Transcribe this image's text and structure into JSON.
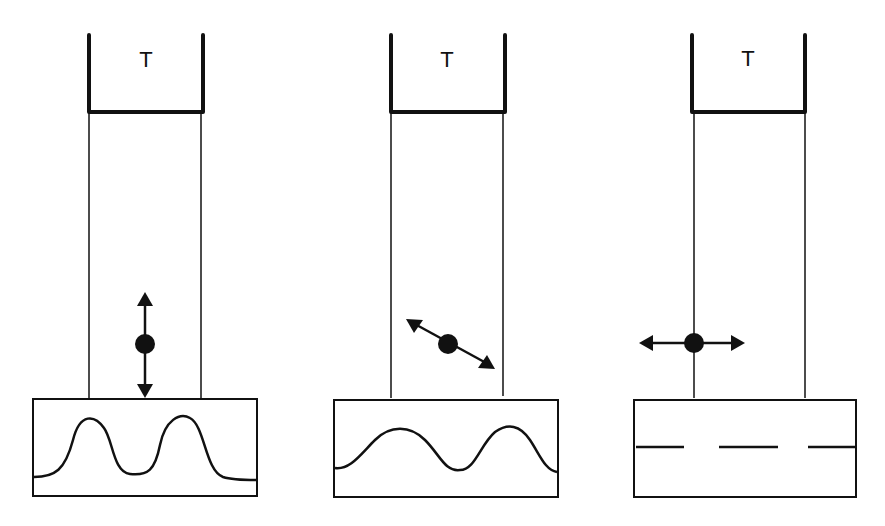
{
  "panels": [
    {
      "id": "panel-1",
      "top_label": "T",
      "vibration_direction": "vertical",
      "trace": "large-amplitude sinusoid"
    },
    {
      "id": "panel-2",
      "top_label": "T",
      "vibration_direction": "diagonal",
      "trace": "medium-amplitude sinusoid"
    },
    {
      "id": "panel-3",
      "top_label": "T",
      "vibration_direction": "horizontal",
      "trace": "flat dashed line"
    }
  ],
  "colors": {
    "stroke": "#111111",
    "background": "#ffffff"
  }
}
